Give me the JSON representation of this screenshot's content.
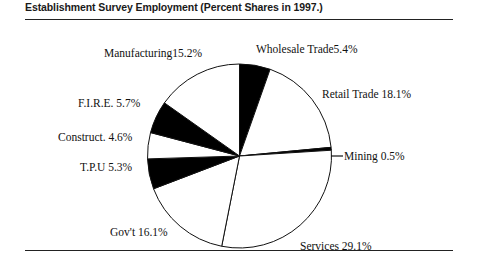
{
  "title": "Establishment Survey Employment (Percent Shares in 1997.)",
  "chart_data": {
    "type": "pie",
    "title": "Establishment Survey Employment (Percent Shares in 1997.)",
    "xlabel": "",
    "ylabel": "",
    "unit": "percent",
    "start_angle_deg": 0,
    "direction": "clockwise",
    "legend": "none (labels placed around pie)",
    "grid": false,
    "categories": [
      "Wholesale Trade",
      "Retail Trade",
      "Mining",
      "Services",
      "Gov't",
      "T.P.U",
      "Construct.",
      "F.I.R.E.",
      "Manufacturing"
    ],
    "values": [
      5.4,
      18.1,
      0.5,
      29.1,
      16.1,
      5.3,
      4.6,
      5.7,
      15.2
    ],
    "slices": [
      {
        "name": "Wholesale Trade",
        "value": 5.4,
        "label": "Wholesale Trade5.4%",
        "fill": "#000000"
      },
      {
        "name": "Retail Trade",
        "value": 18.1,
        "label": "Retail Trade 18.1%",
        "fill": "#ffffff"
      },
      {
        "name": "Mining",
        "value": 0.5,
        "label": "Mining  0.5%",
        "fill": "#000000"
      },
      {
        "name": "Services",
        "value": 29.1,
        "label": "Services  29.1%",
        "fill": "#ffffff"
      },
      {
        "name": "Gov't",
        "value": 16.1,
        "label": "Gov't  16.1%",
        "fill": "#ffffff"
      },
      {
        "name": "T.P.U",
        "value": 5.3,
        "label": "T.P.U  5.3%",
        "fill": "#000000"
      },
      {
        "name": "Construct.",
        "value": 4.6,
        "label": "Construct.  4.6%",
        "fill": "#ffffff"
      },
      {
        "name": "F.I.R.E.",
        "value": 5.7,
        "label": "F.I.R.E.  5.7%",
        "fill": "#000000"
      },
      {
        "name": "Manufacturing",
        "value": 15.2,
        "label": "Manufacturing15.2%",
        "fill": "#ffffff"
      }
    ]
  },
  "colors": {
    "ink": "#111111",
    "rule": "#222222",
    "slice_dark": "#000000",
    "slice_light": "#ffffff",
    "background": "#ffffff"
  }
}
